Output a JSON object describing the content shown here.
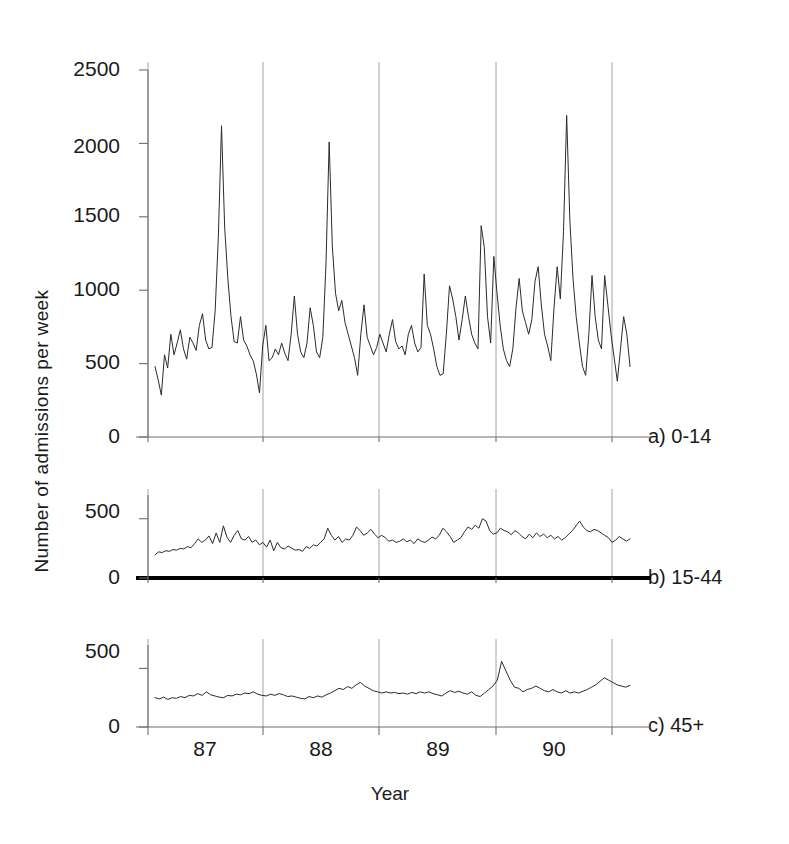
{
  "figure": {
    "background": "#ffffff",
    "line_color": "#2b2b2b",
    "axis_color": "#6e6e6e",
    "grid_color": "#9a9a9a",
    "baseline_color": "#000000"
  },
  "axis": {
    "ylabel": "Number  of  admissions per week",
    "xlabel": "Year",
    "xticklabels": [
      "87",
      "88",
      "89",
      "90"
    ],
    "yticklabels_a": [
      "0",
      "500",
      "1000",
      "1500",
      "2000",
      "2500"
    ],
    "yticklabels_b": [
      "0",
      "500"
    ],
    "yticklabels_c": [
      "0",
      "500"
    ]
  },
  "panels": [
    {
      "key": "a",
      "label": "a) 0-14"
    },
    {
      "key": "b",
      "label": "b) 15-44"
    },
    {
      "key": "c",
      "label": "c) 45+"
    }
  ],
  "chart_data": {
    "type": "line",
    "title": "",
    "xlabel": "Year",
    "ylabel": "Number  of  admissions per week",
    "x_unit": "week",
    "x_tick_labels": [
      "87",
      "88",
      "89",
      "90"
    ],
    "x_tick_positions_year_fraction": [
      1987.0,
      1988.0,
      1989.0,
      1990.0,
      1991.0
    ],
    "grid": "vertical-year-boundaries",
    "legend": "panel-labels-right",
    "panels": [
      {
        "id": "a",
        "label": "a) 0-14",
        "ylim": [
          0,
          2500
        ],
        "yticks": [
          0,
          500,
          1000,
          1500,
          2000,
          2500
        ],
        "series_name": "Admissions per week, age 0-14",
        "values": [
          480,
          390,
          285,
          560,
          470,
          700,
          560,
          640,
          730,
          600,
          530,
          680,
          640,
          590,
          760,
          840,
          660,
          600,
          610,
          860,
          1360,
          2120,
          1430,
          1080,
          820,
          650,
          640,
          820,
          660,
          620,
          560,
          520,
          430,
          300,
          620,
          760,
          520,
          540,
          600,
          560,
          640,
          570,
          520,
          700,
          960,
          700,
          580,
          540,
          640,
          880,
          760,
          580,
          540,
          680,
          1180,
          2010,
          1300,
          980,
          860,
          930,
          780,
          700,
          620,
          540,
          420,
          700,
          900,
          680,
          620,
          560,
          610,
          700,
          640,
          580,
          700,
          800,
          650,
          600,
          620,
          560,
          700,
          760,
          640,
          580,
          610,
          1110,
          760,
          700,
          600,
          480,
          420,
          430,
          700,
          1030,
          940,
          820,
          660,
          800,
          960,
          820,
          700,
          640,
          600,
          1440,
          1290,
          820,
          640,
          1230,
          980,
          760,
          600,
          520,
          480,
          600,
          880,
          1080,
          860,
          780,
          700,
          800,
          1060,
          1160,
          900,
          700,
          620,
          520,
          880,
          1160,
          940,
          1400,
          2190,
          1480,
          1080,
          820,
          640,
          480,
          420,
          700,
          1100,
          820,
          660,
          600,
          1100,
          900,
          700,
          540,
          380,
          600,
          820,
          700,
          480
        ]
      },
      {
        "id": "b",
        "label": "b) 15-44",
        "ylim": [
          0,
          700
        ],
        "yticks": [
          0,
          500
        ],
        "series_name": "Admissions per week, age 15-44",
        "values": [
          195,
          220,
          215,
          230,
          225,
          240,
          235,
          250,
          245,
          265,
          255,
          290,
          330,
          300,
          320,
          355,
          290,
          380,
          300,
          440,
          345,
          300,
          360,
          400,
          330,
          320,
          350,
          300,
          320,
          280,
          300,
          260,
          320,
          230,
          300,
          255,
          245,
          270,
          250,
          235,
          240,
          225,
          265,
          250,
          280,
          270,
          300,
          330,
          420,
          360,
          320,
          350,
          300,
          330,
          320,
          360,
          430,
          400,
          360,
          380,
          410,
          370,
          340,
          360,
          340,
          310,
          320,
          300,
          310,
          330,
          305,
          320,
          290,
          330,
          310,
          300,
          320,
          345,
          330,
          360,
          420,
          390,
          350,
          300,
          320,
          340,
          390,
          430,
          410,
          445,
          420,
          500,
          480,
          400,
          370,
          380,
          420,
          400,
          390,
          365,
          400,
          380,
          350,
          330,
          370,
          340,
          380,
          350,
          370,
          340,
          360,
          330,
          350,
          320,
          340,
          370,
          400,
          440,
          480,
          430,
          400,
          390,
          410,
          400,
          380,
          360,
          340,
          300,
          320,
          350,
          330,
          310,
          330
        ]
      },
      {
        "id": "c",
        "label": "c) 45+",
        "ylim": [
          0,
          700
        ],
        "yticks": [
          0,
          500
        ],
        "series_name": "Admissions per week, age 45+",
        "values": [
          250,
          240,
          255,
          235,
          250,
          245,
          260,
          250,
          270,
          265,
          285,
          270,
          300,
          275,
          265,
          255,
          250,
          270,
          265,
          280,
          275,
          290,
          285,
          300,
          280,
          270,
          265,
          280,
          270,
          285,
          275,
          260,
          265,
          255,
          245,
          240,
          260,
          250,
          265,
          255,
          275,
          290,
          310,
          330,
          320,
          345,
          330,
          360,
          380,
          350,
          330,
          310,
          300,
          290,
          300,
          290,
          295,
          285,
          290,
          280,
          295,
          285,
          300,
          290,
          300,
          285,
          275,
          265,
          290,
          310,
          295,
          305,
          290,
          280,
          300,
          270,
          260,
          290,
          320,
          350,
          400,
          560,
          480,
          400,
          340,
          330,
          300,
          320,
          330,
          350,
          330,
          310,
          300,
          320,
          300,
          290,
          310,
          290,
          300,
          290,
          305,
          320,
          340,
          360,
          390,
          420,
          400,
          380,
          360,
          350,
          340,
          355
        ]
      }
    ]
  }
}
